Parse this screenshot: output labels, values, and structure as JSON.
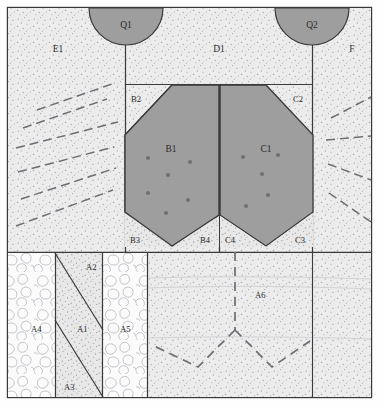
{
  "figure": {
    "type": "archaeological-section-diagram",
    "frame": {
      "x": 7,
      "y": 7,
      "width": 365,
      "height": 391,
      "stroke": "#3a3a3a"
    },
    "colors": {
      "fill_stipple": "#ececec",
      "fill_grey_unit": "#9e9e9e",
      "fill_rubble": "#fbfbfb",
      "line": "#3a3a3a",
      "dashed_line": "#6a6a6a",
      "stipple_dot": "#9a9aa4",
      "background": "#fefefe"
    }
  },
  "units": [
    {
      "id": "Q1",
      "label": "Q1",
      "shape": "semicircle-down",
      "fill": "grey",
      "cx": 126,
      "cy": 8,
      "r": 37
    },
    {
      "id": "Q2",
      "label": "Q2",
      "shape": "semicircle-down",
      "fill": "grey",
      "cx": 312,
      "cy": 8,
      "r": 37
    },
    {
      "id": "E1",
      "label": "E1",
      "shape": "panel",
      "fill": "stipple",
      "lx": 58,
      "ly": 48
    },
    {
      "id": "D1",
      "label": "D1",
      "shape": "panel",
      "fill": "stipple",
      "lx": 219,
      "ly": 48
    },
    {
      "id": "F",
      "label": "F",
      "shape": "panel",
      "fill": "stipple",
      "lx": 352,
      "ly": 48
    },
    {
      "id": "B2",
      "label": "B2",
      "shape": "chamfer-corner",
      "fill": "stipple",
      "lx": 131,
      "ly": 100
    },
    {
      "id": "C2",
      "label": "C2",
      "shape": "chamfer-corner",
      "fill": "stipple",
      "lx": 293,
      "ly": 100
    },
    {
      "id": "B1",
      "label": "B1",
      "shape": "shield",
      "fill": "grey",
      "lx": 168,
      "ly": 150
    },
    {
      "id": "C1",
      "label": "C1",
      "shape": "shield",
      "fill": "grey",
      "lx": 265,
      "ly": 150
    },
    {
      "id": "B3",
      "label": "B3",
      "shape": "wedge",
      "fill": "stipple",
      "lx": 132,
      "ly": 243
    },
    {
      "id": "B4",
      "label": "B4",
      "shape": "wedge",
      "fill": "stipple",
      "lx": 203,
      "ly": 243
    },
    {
      "id": "C4",
      "label": "C4",
      "shape": "wedge",
      "fill": "stipple",
      "lx": 228,
      "ly": 243
    },
    {
      "id": "C3",
      "label": "C3",
      "shape": "wedge",
      "fill": "stipple",
      "lx": 297,
      "ly": 243
    },
    {
      "id": "A4",
      "label": "A4",
      "shape": "column",
      "fill": "rubble",
      "lx": 33,
      "ly": 330
    },
    {
      "id": "A2",
      "label": "A2",
      "shape": "triangle-upper",
      "fill": "stipple",
      "lx": 89,
      "ly": 268
    },
    {
      "id": "A1",
      "label": "A1",
      "shape": "diagonal-band",
      "fill": "stipple",
      "lx": 81,
      "ly": 330
    },
    {
      "id": "A3",
      "label": "A3",
      "shape": "triangle-lower",
      "fill": "stipple",
      "lx": 70,
      "ly": 390
    },
    {
      "id": "A5",
      "label": "A5",
      "shape": "column",
      "fill": "rubble",
      "lx": 124,
      "ly": 330
    },
    {
      "id": "A6",
      "label": "A6",
      "shape": "panel",
      "fill": "stipple",
      "lx": 260,
      "ly": 296
    }
  ],
  "finds": {
    "description": "stone/artefact point markers",
    "radius": 2.1,
    "color": "#707070",
    "B1": [
      [
        148,
        158
      ],
      [
        190,
        162
      ],
      [
        168,
        175
      ],
      [
        148,
        193
      ],
      [
        188,
        200
      ],
      [
        166,
        213
      ]
    ],
    "C1": [
      [
        243,
        157
      ],
      [
        278,
        155
      ],
      [
        262,
        174
      ],
      [
        268,
        195
      ],
      [
        246,
        206
      ]
    ]
  },
  "dashed_fans": {
    "E1": [
      [
        [
          37,
          110
        ],
        [
          112,
          84
        ]
      ],
      [
        [
          23,
          128
        ],
        [
          107,
          99
        ]
      ],
      [
        [
          16,
          148
        ],
        [
          118,
          122
        ]
      ],
      [
        [
          18,
          172
        ],
        [
          114,
          147
        ]
      ],
      [
        [
          21,
          199
        ],
        [
          116,
          168
        ]
      ],
      [
        [
          16,
          226
        ],
        [
          113,
          190
        ]
      ]
    ],
    "F": [
      [
        [
          331,
          118
        ],
        [
          370,
          97
        ]
      ],
      [
        [
          326,
          140
        ],
        [
          372,
          136
        ]
      ],
      [
        [
          328,
          164
        ],
        [
          372,
          180
        ]
      ],
      [
        [
          329,
          193
        ],
        [
          372,
          222
        ]
      ]
    ],
    "A6": [
      [
        [
          235,
          252
        ],
        [
          235,
          330
        ]
      ],
      [
        [
          235,
          330
        ],
        [
          198,
          367
        ]
      ],
      [
        [
          198,
          367
        ],
        [
          152,
          345
        ]
      ],
      [
        [
          235,
          330
        ],
        [
          272,
          367
        ]
      ],
      [
        [
          272,
          367
        ],
        [
          310,
          341
        ]
      ]
    ]
  },
  "caption": {
    "present": false
  }
}
